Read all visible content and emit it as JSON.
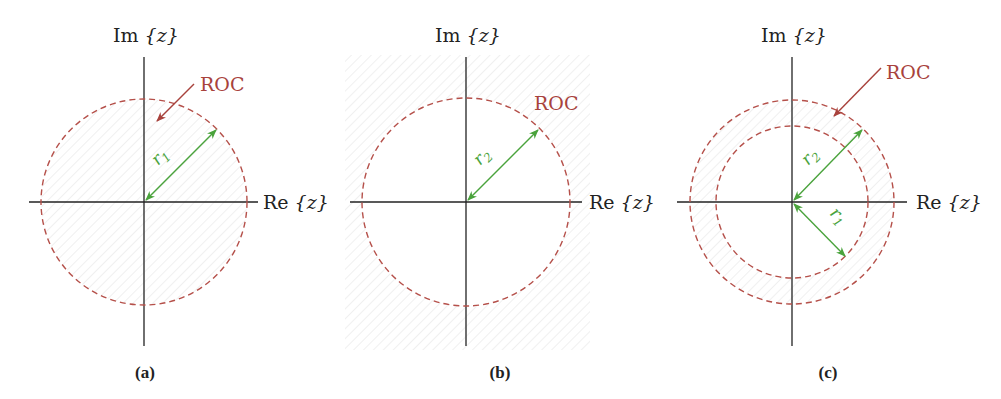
{
  "figure": {
    "colors": {
      "axis": "#222222",
      "roc": "#a8423c",
      "roc_circle": "#b5504a",
      "radius_arrow": "#4aa33c",
      "hatch": "#e4e4e4"
    },
    "panels": [
      {
        "id": "a",
        "label": "(a)",
        "im_label_prefix": "Im",
        "im_label_var": "{z}",
        "re_label_prefix": "Re",
        "re_label_var": "{z}",
        "roc_label": "ROC",
        "roc_region": "inside |z| < r1",
        "circles": [
          {
            "name": "r1",
            "radius_label": "r",
            "radius_sub": "1"
          }
        ],
        "has_roc_pointer_arrow": true
      },
      {
        "id": "b",
        "label": "(b)",
        "im_label_prefix": "Im",
        "im_label_var": "{z}",
        "re_label_prefix": "Re",
        "re_label_var": "{z}",
        "roc_label": "ROC",
        "roc_region": "outside |z| > r2",
        "circles": [
          {
            "name": "r2",
            "radius_label": "r",
            "radius_sub": "2"
          }
        ],
        "has_roc_pointer_arrow": false
      },
      {
        "id": "c",
        "label": "(c)",
        "im_label_prefix": "Im",
        "im_label_var": "{z}",
        "re_label_prefix": "Re",
        "re_label_var": "{z}",
        "roc_label": "ROC",
        "roc_region": "annulus r1 < |z| < r2",
        "circles": [
          {
            "name": "r2",
            "radius_label": "r",
            "radius_sub": "2"
          },
          {
            "name": "r1",
            "radius_label": "r",
            "radius_sub": "1"
          }
        ],
        "has_roc_pointer_arrow": true
      }
    ]
  }
}
